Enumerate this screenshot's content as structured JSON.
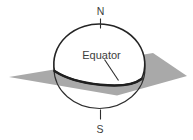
{
  "diagram": {
    "labels": {
      "north": "N",
      "south": "S",
      "equator": "Equator"
    },
    "colors": {
      "plane_fill": "#a9a9a9",
      "line": "#2e2e2e",
      "text": "#3d3d3d",
      "background": "#ffffff"
    }
  }
}
